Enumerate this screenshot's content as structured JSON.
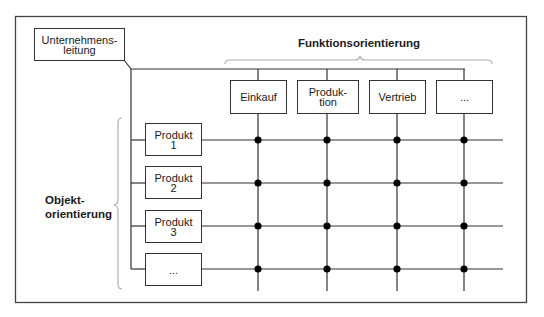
{
  "diagram": {
    "title_top": "Funktionsorientierung",
    "title_left": "Objekt-\norientierung",
    "root": {
      "label": "Unternehmens-\nleitung"
    },
    "functions": [
      {
        "label": "Einkauf"
      },
      {
        "label": "Produk-\ntion"
      },
      {
        "label": "Vertrieb"
      },
      {
        "label": "..."
      }
    ],
    "objects": [
      {
        "label": "Produkt\n1"
      },
      {
        "label": "Produkt\n2"
      },
      {
        "label": "Produkt\n3"
      },
      {
        "label": "..."
      }
    ],
    "colors": {
      "line": "#333333",
      "brace": "#b0b0b0",
      "node": "#000000"
    }
  }
}
